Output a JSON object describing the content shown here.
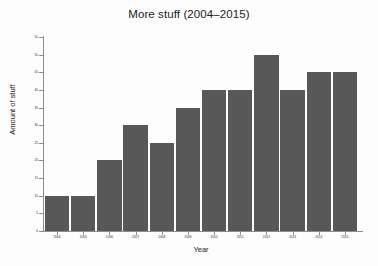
{
  "chart_data": {
    "type": "bar",
    "title": "More stuff (2004–2015)",
    "xlabel": "Year",
    "ylabel": "Amount of stuff",
    "categories": [
      "2004",
      "2005",
      "2006",
      "2007",
      "2008",
      "2009",
      "2010",
      "2011",
      "2012",
      "2013",
      "2014",
      "2015"
    ],
    "values": [
      10,
      10,
      20,
      30,
      25,
      35,
      40,
      40,
      50,
      40,
      45,
      45
    ],
    "ylim": [
      0,
      55
    ],
    "ytick_values": [
      0,
      5,
      10,
      15,
      20,
      25,
      30,
      35,
      40,
      45,
      50,
      55
    ],
    "ytick_labels": [
      "0",
      "5",
      "10",
      "15",
      "20",
      "25",
      "30",
      "35",
      "40",
      "45",
      "50",
      "55"
    ],
    "grid": false,
    "legend": null,
    "bar_color": "#585858",
    "axis_color": "#8d8d8d",
    "background_color": "#ffffff"
  }
}
